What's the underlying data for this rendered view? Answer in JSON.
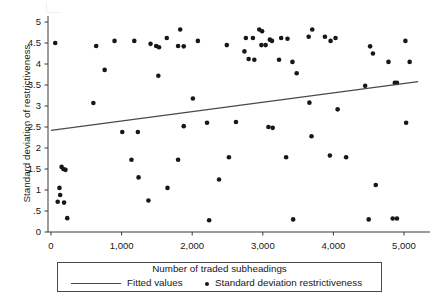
{
  "chart_data": {
    "type": "scatter",
    "title": "",
    "xlabel": "Number of traded subheadings",
    "ylabel": "Standard deviation of restrictiveness",
    "xlim": [
      -150,
      5250
    ],
    "ylim": [
      0,
      5.2
    ],
    "grid": false,
    "xticks": [
      0,
      1000,
      2000,
      3000,
      4000,
      5000
    ],
    "xticklabels": [
      "0",
      "1,000",
      "2,000",
      "3,000",
      "4,000",
      "5,000"
    ],
    "yticks": [
      0,
      0.5,
      1,
      1.5,
      2,
      2.5,
      3,
      3.5,
      4,
      4.5,
      5
    ],
    "yticklabels": [
      "0",
      ".5",
      "1",
      "1.5",
      "2",
      "2.5",
      "3",
      "3.5",
      "4",
      "4.5",
      "5"
    ],
    "legend_position": "below-axis",
    "legend": [
      {
        "label": "Fitted values",
        "marker": "line",
        "color": "#4a4a4a"
      },
      {
        "label": "Standard deviation restrictiveness",
        "marker": "dot",
        "color": "#171717"
      }
    ],
    "series": [
      {
        "name": "Standard deviation restrictiveness",
        "type": "scatter",
        "marker": "dot",
        "color": "#171717",
        "points": [
          [
            60,
            4.5
          ],
          [
            150,
            1.55
          ],
          [
            175,
            1.5
          ],
          [
            205,
            1.48
          ],
          [
            120,
            1.05
          ],
          [
            130,
            0.88
          ],
          [
            95,
            0.72
          ],
          [
            185,
            0.7
          ],
          [
            230,
            0.33
          ],
          [
            640,
            4.43
          ],
          [
            600,
            3.07
          ],
          [
            760,
            3.86
          ],
          [
            1010,
            2.38
          ],
          [
            1230,
            2.38
          ],
          [
            1180,
            4.55
          ],
          [
            1140,
            1.72
          ],
          [
            1240,
            1.3
          ],
          [
            1410,
            4.48
          ],
          [
            1490,
            4.43
          ],
          [
            1530,
            4.4
          ],
          [
            1520,
            3.72
          ],
          [
            1640,
            4.62
          ],
          [
            1650,
            1.05
          ],
          [
            1800,
            4.43
          ],
          [
            1880,
            4.42
          ],
          [
            1830,
            4.82
          ],
          [
            1880,
            2.52
          ],
          [
            1800,
            1.72
          ],
          [
            2080,
            4.55
          ],
          [
            2010,
            3.18
          ],
          [
            2210,
            2.6
          ],
          [
            2240,
            0.28
          ],
          [
            2490,
            4.45
          ],
          [
            2520,
            1.78
          ],
          [
            2620,
            2.62
          ],
          [
            2760,
            4.62
          ],
          [
            2740,
            4.3
          ],
          [
            2800,
            4.12
          ],
          [
            2880,
            4.1
          ],
          [
            2860,
            4.62
          ],
          [
            2950,
            4.82
          ],
          [
            2990,
            4.78
          ],
          [
            2980,
            4.45
          ],
          [
            3040,
            4.45
          ],
          [
            3100,
            4.58
          ],
          [
            3130,
            4.55
          ],
          [
            3080,
            2.5
          ],
          [
            3140,
            2.48
          ],
          [
            3260,
            4.62
          ],
          [
            3230,
            4.1
          ],
          [
            3350,
            4.6
          ],
          [
            3330,
            1.78
          ],
          [
            3420,
            4.05
          ],
          [
            3480,
            3.78
          ],
          [
            3430,
            0.3
          ],
          [
            3650,
            4.65
          ],
          [
            3700,
            4.82
          ],
          [
            3660,
            3.08
          ],
          [
            3690,
            2.28
          ],
          [
            3880,
            4.65
          ],
          [
            3960,
            4.55
          ],
          [
            3950,
            1.82
          ],
          [
            4030,
            4.62
          ],
          [
            4060,
            2.92
          ],
          [
            4180,
            1.78
          ],
          [
            4450,
            3.48
          ],
          [
            4520,
            4.42
          ],
          [
            4560,
            4.25
          ],
          [
            4500,
            0.3
          ],
          [
            4780,
            4.05
          ],
          [
            4870,
            3.55
          ],
          [
            4900,
            3.55
          ],
          [
            4840,
            0.32
          ],
          [
            4900,
            0.32
          ],
          [
            5020,
            4.55
          ],
          [
            5080,
            4.05
          ],
          [
            5030,
            2.6
          ],
          [
            4600,
            1.12
          ],
          [
            2380,
            1.25
          ],
          [
            1380,
            0.75
          ],
          [
            900,
            4.55
          ]
        ]
      },
      {
        "name": "Fitted values",
        "type": "line",
        "color": "#4a4a4a",
        "points": [
          [
            0,
            2.42
          ],
          [
            5200,
            3.58
          ]
        ]
      }
    ]
  },
  "legend_panel": {
    "xaxis_title": "Number of traded subheadings",
    "fitted_label": "Fitted values",
    "scatter_label": "Standard deviation restrictiveness"
  }
}
